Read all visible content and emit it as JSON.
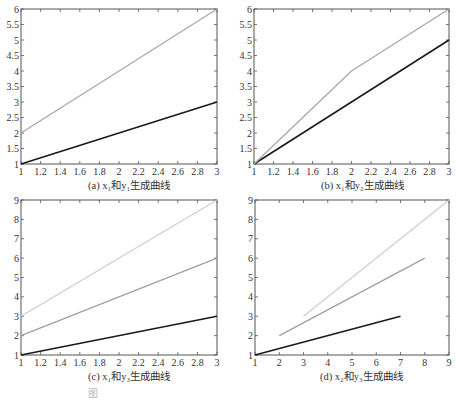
{
  "figure": {
    "caption_partial": "图"
  },
  "panels": [
    {
      "id": "a",
      "caption": "(a) x₁和y₁生成曲线",
      "box": {
        "x0": 21,
        "y0": 9,
        "x1": 217,
        "y1": 164
      },
      "xlim": [
        1,
        3
      ],
      "ylim": [
        1,
        6
      ],
      "xticks": [
        1,
        1.2,
        1.4,
        1.6,
        1.8,
        2,
        2.2,
        2.4,
        2.6,
        2.8,
        3
      ],
      "yticks": [
        1,
        1.5,
        2,
        2.5,
        3,
        3.5,
        4,
        4.5,
        5,
        5.5,
        6
      ]
    },
    {
      "id": "b",
      "caption": "(b) x₁和y₂生成曲线",
      "box": {
        "x0": 254,
        "y0": 9,
        "x1": 449,
        "y1": 164
      },
      "xlim": [
        1,
        3
      ],
      "ylim": [
        1,
        6
      ],
      "xticks": [
        1,
        1.2,
        1.4,
        1.6,
        1.8,
        2,
        2.2,
        2.4,
        2.6,
        2.8,
        3
      ],
      "yticks": [
        1,
        1.5,
        2,
        2.5,
        3,
        3.5,
        4,
        4.5,
        5,
        5.5,
        6
      ]
    },
    {
      "id": "c",
      "caption": "(c) x₁和y₃生成曲线",
      "box": {
        "x0": 21,
        "y0": 200,
        "x1": 217,
        "y1": 355
      },
      "xlim": [
        1,
        3
      ],
      "ylim": [
        1,
        9
      ],
      "xticks": [
        1,
        1.2,
        1.4,
        1.6,
        1.8,
        2,
        2.2,
        2.4,
        2.6,
        2.8,
        3
      ],
      "yticks": [
        1,
        2,
        3,
        4,
        5,
        6,
        7,
        8,
        9
      ]
    },
    {
      "id": "d",
      "caption": "(d) x₂和y₃生成曲线",
      "box": {
        "x0": 255,
        "y0": 200,
        "x1": 449,
        "y1": 355
      },
      "xlim": [
        1,
        9
      ],
      "ylim": [
        1,
        9
      ],
      "xticks": [
        1,
        2,
        3,
        4,
        5,
        6,
        7,
        8,
        9
      ],
      "yticks": [
        1,
        2,
        3,
        4,
        5,
        6,
        7,
        8,
        9
      ]
    }
  ],
  "chart_data": [
    {
      "type": "line",
      "title": "(a) x1和y1生成曲线",
      "xlabel": "",
      "ylabel": "",
      "xlim": [
        1,
        3
      ],
      "ylim": [
        1,
        6
      ],
      "grid": false,
      "series": [
        {
          "name": "black",
          "color": "#1a1a1a",
          "x": [
            1,
            3
          ],
          "y": [
            1,
            3
          ]
        },
        {
          "name": "gray",
          "color": "#a8a8a8",
          "x": [
            1,
            3
          ],
          "y": [
            2,
            6
          ]
        }
      ]
    },
    {
      "type": "line",
      "title": "(b) x1和y2生成曲线",
      "xlabel": "",
      "ylabel": "",
      "xlim": [
        1,
        3
      ],
      "ylim": [
        1,
        6
      ],
      "grid": false,
      "series": [
        {
          "name": "black",
          "color": "#1a1a1a",
          "x": [
            1,
            3
          ],
          "y": [
            1,
            5
          ]
        },
        {
          "name": "gray",
          "color": "#a8a8a8",
          "x": [
            1,
            2,
            3
          ],
          "y": [
            1,
            4,
            6
          ]
        }
      ]
    },
    {
      "type": "line",
      "title": "(c) x1和y3生成曲线",
      "xlabel": "",
      "ylabel": "",
      "xlim": [
        1,
        3
      ],
      "ylim": [
        1,
        9
      ],
      "grid": false,
      "series": [
        {
          "name": "black",
          "color": "#1a1a1a",
          "x": [
            1,
            3
          ],
          "y": [
            1,
            3
          ]
        },
        {
          "name": "mid-gray",
          "color": "#a0a0a0",
          "x": [
            1,
            3
          ],
          "y": [
            2,
            6
          ]
        },
        {
          "name": "light-gray",
          "color": "#cfcfcf",
          "x": [
            1,
            3
          ],
          "y": [
            3,
            9
          ]
        }
      ]
    },
    {
      "type": "line",
      "title": "(d) x2和y3生成曲线",
      "xlabel": "",
      "ylabel": "",
      "xlim": [
        1,
        9
      ],
      "ylim": [
        1,
        9
      ],
      "grid": false,
      "series": [
        {
          "name": "black",
          "color": "#1a1a1a",
          "x": [
            1,
            7
          ],
          "y": [
            1,
            3
          ]
        },
        {
          "name": "mid-gray",
          "color": "#a0a0a0",
          "x": [
            2,
            8
          ],
          "y": [
            2,
            6
          ]
        },
        {
          "name": "light-gray",
          "color": "#cfcfcf",
          "x": [
            3,
            9
          ],
          "y": [
            3,
            9
          ]
        }
      ]
    }
  ]
}
